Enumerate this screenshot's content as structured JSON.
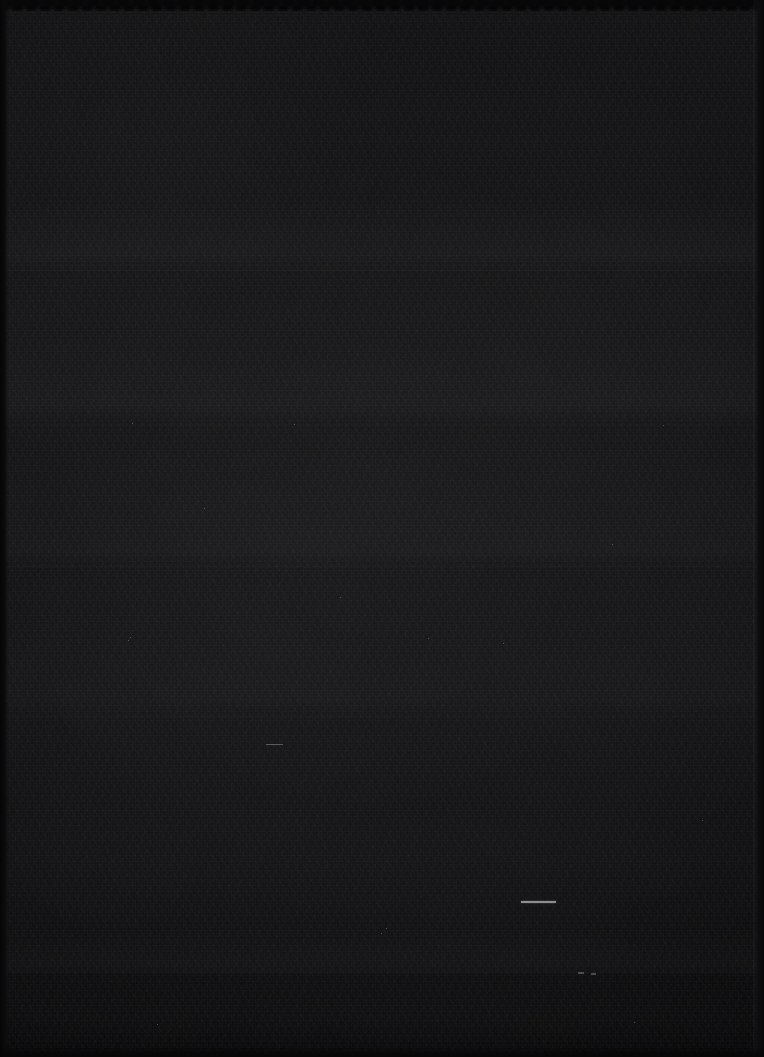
{
  "image": {
    "kind": "near-black-frame",
    "width": 764,
    "height": 1057,
    "description": "Almost entirely black, heavily underexposed frame with visible sensor noise grain. No readable text, icons, or UI chrome is present.",
    "dominant_color": "#151517",
    "background_color": "#141416",
    "noise_visible": "yes",
    "readable_text": "none"
  },
  "tonal_bands": {
    "label": "Horizontal luminance bands",
    "boundaries_y": [
      8,
      270,
      424,
      566,
      716,
      972,
      1047
    ],
    "values_hex": [
      "#0b0b0c",
      "#18181a",
      "#151517",
      "#161619",
      "#141416",
      "#101012",
      "#0a0a0b"
    ]
  },
  "edges": {
    "top": {
      "label": "Top dark scalloped edge",
      "height_px": 9,
      "color": "#070708"
    },
    "left": {
      "label": "Left dark edge strip",
      "width_px": 8,
      "color": "#050506"
    },
    "right": {
      "label": "Right dark edge strip",
      "width_px": 10,
      "color": "#060607"
    },
    "bottom": {
      "label": "Bottom dark edge strip",
      "height_px": 10,
      "color": "#060607"
    }
  },
  "features": [
    {
      "id": "highlight-line",
      "label": "Bright horizontal line segment",
      "x": 521,
      "y": 901,
      "width": 35,
      "height": 2,
      "color": "#8d8d8d"
    },
    {
      "id": "faint-mark-upper-left",
      "label": "Faint short horizontal mark",
      "x": 266,
      "y": 744,
      "width": 17,
      "height": 1,
      "color": "#5a5a5a"
    },
    {
      "id": "faint-mark-lower-right-a",
      "label": "Faint small mark",
      "x": 578,
      "y": 972,
      "width": 6,
      "height": 2,
      "color": "#4e4e4e"
    },
    {
      "id": "faint-mark-lower-right-b",
      "label": "Faint small mark",
      "x": 591,
      "y": 973,
      "width": 5,
      "height": 2,
      "color": "#4a4a4a"
    }
  ],
  "caption": "Near-black underexposed frame"
}
